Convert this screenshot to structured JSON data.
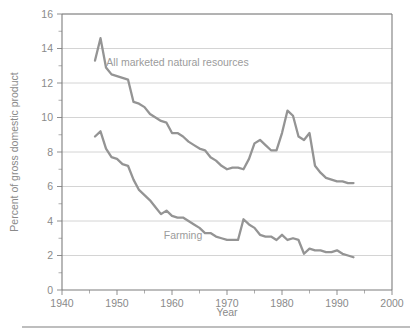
{
  "chart_data": {
    "type": "line",
    "title": "",
    "xlabel": "Year",
    "ylabel": "Percent of gross domestic product",
    "xlim": [
      1940,
      2000
    ],
    "ylim": [
      0,
      16
    ],
    "grid": true,
    "legend": "inline-labels",
    "x_ticks": [
      1940,
      1950,
      1960,
      1970,
      1980,
      1990,
      2000
    ],
    "x_tick_labels": [
      "1940",
      "1950",
      "1960",
      "1970",
      "1980",
      "1990",
      "2000"
    ],
    "x_minor_ticks": [
      1945,
      1955,
      1965,
      1975,
      1985,
      1995
    ],
    "y_ticks": [
      0,
      2,
      4,
      6,
      8,
      10,
      12,
      14,
      16
    ],
    "y_tick_labels": [
      "0",
      "2",
      "4",
      "6",
      "8",
      "10",
      "12",
      "14",
      "16"
    ],
    "y_minor_ticks": [
      1,
      3,
      5,
      7,
      9,
      11,
      13,
      15
    ],
    "line_color": "#949494",
    "grid_color": "#c9c9c9",
    "axis_color": "#7d7d7d",
    "text_color": "#8a8a8a",
    "series": [
      {
        "name": "All marketed natural resources",
        "label_x": 1961,
        "label_y": 13.0,
        "x": [
          1946,
          1947,
          1948,
          1949,
          1950,
          1951,
          1952,
          1953,
          1954,
          1955,
          1956,
          1957,
          1958,
          1959,
          1960,
          1961,
          1962,
          1963,
          1964,
          1965,
          1966,
          1967,
          1968,
          1969,
          1970,
          1971,
          1972,
          1973,
          1974,
          1975,
          1976,
          1977,
          1978,
          1979,
          1980,
          1981,
          1982,
          1983,
          1984,
          1985,
          1986,
          1987,
          1988,
          1989,
          1990,
          1991,
          1992,
          1993
        ],
        "values": [
          13.3,
          14.6,
          12.9,
          12.5,
          12.4,
          12.3,
          12.2,
          10.9,
          10.8,
          10.6,
          10.2,
          10.0,
          9.8,
          9.7,
          9.1,
          9.1,
          8.9,
          8.6,
          8.4,
          8.2,
          8.1,
          7.7,
          7.5,
          7.2,
          7.0,
          7.1,
          7.1,
          7.0,
          7.6,
          8.5,
          8.7,
          8.4,
          8.1,
          8.1,
          9.1,
          10.4,
          10.1,
          8.9,
          8.7,
          9.1,
          7.2,
          6.8,
          6.5,
          6.4,
          6.3,
          6.3,
          6.2,
          6.2
        ]
      },
      {
        "name": "Farming",
        "label_x": 1962,
        "label_y": 2.95,
        "x": [
          1946,
          1947,
          1948,
          1949,
          1950,
          1951,
          1952,
          1953,
          1954,
          1955,
          1956,
          1957,
          1958,
          1959,
          1960,
          1961,
          1962,
          1963,
          1964,
          1965,
          1966,
          1967,
          1968,
          1969,
          1970,
          1971,
          1972,
          1973,
          1974,
          1975,
          1976,
          1977,
          1978,
          1979,
          1980,
          1981,
          1982,
          1983,
          1984,
          1985,
          1986,
          1987,
          1988,
          1989,
          1990,
          1991,
          1992,
          1993
        ],
        "values": [
          8.9,
          9.2,
          8.2,
          7.7,
          7.6,
          7.3,
          7.2,
          6.4,
          5.8,
          5.5,
          5.2,
          4.8,
          4.4,
          4.6,
          4.3,
          4.2,
          4.2,
          4.0,
          3.8,
          3.6,
          3.3,
          3.3,
          3.1,
          3.0,
          2.9,
          2.9,
          2.9,
          4.1,
          3.8,
          3.6,
          3.2,
          3.1,
          3.1,
          2.9,
          3.2,
          2.9,
          3.0,
          2.9,
          2.1,
          2.4,
          2.3,
          2.3,
          2.2,
          2.2,
          2.3,
          2.1,
          2.0,
          1.9
        ]
      }
    ]
  },
  "footer": {
    "rule": "horizontal-rule"
  }
}
